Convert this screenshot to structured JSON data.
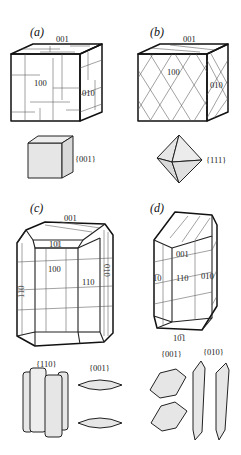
{
  "figure": {
    "panels": [
      {
        "id": "a",
        "label": "(a)",
        "crystal_faces": {
          "top": "001",
          "front": "100",
          "side": "010"
        },
        "habit_label": "{001}",
        "habit_shape": "cube"
      },
      {
        "id": "b",
        "label": "(b)",
        "crystal_faces": {
          "top": "001",
          "front": "100",
          "side": "010"
        },
        "habit_label": "{111}",
        "habit_shape": "octahedron"
      },
      {
        "id": "c",
        "label": "(c)",
        "crystal_faces": {
          "top": "001",
          "top_bevel": "101",
          "front": "100",
          "left": "1̅0",
          "right": "110",
          "side": "010"
        },
        "crystal_faces_display": {
          "left": "110"
        },
        "habit_labels": [
          "{110}",
          "{001}"
        ],
        "habit_shapes": [
          "prismatic plates",
          "lenticular plates"
        ]
      },
      {
        "id": "d",
        "label": "(d)",
        "crystal_faces": {
          "top": "001",
          "left": "1̅0",
          "front": "110",
          "side": "010",
          "bottom": "10̅1"
        },
        "habit_labels": [
          "{001}",
          "{010}"
        ],
        "habit_shapes": [
          "hexagonal plates",
          "elongated blades"
        ]
      }
    ]
  }
}
